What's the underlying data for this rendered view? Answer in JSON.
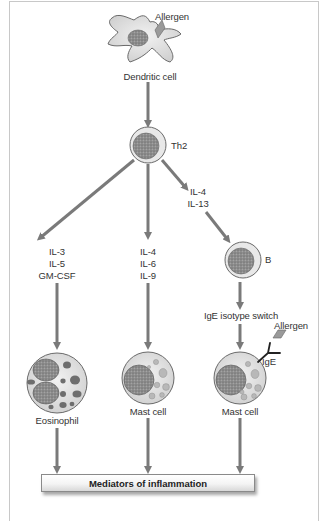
{
  "diagram": {
    "nodes": {
      "dendritic_cell": {
        "label": "Dendritic cell",
        "allergen_label": "Allergen"
      },
      "th2": {
        "label": "Th2"
      },
      "b_cell": {
        "label": "B"
      },
      "eosinophil": {
        "label": "Eosinophil"
      },
      "mast_cell_1": {
        "label": "Mast cell"
      },
      "mast_cell_2": {
        "label": "Mast cell",
        "allergen_label": "Allergen",
        "ige_label": "IgE"
      },
      "mediators": {
        "label": "Mediators of inflammation"
      }
    },
    "edges": {
      "left_cytokines": [
        "IL-3",
        "IL-5",
        "GM-CSF"
      ],
      "middle_cytokines": [
        "IL-4",
        "IL-6",
        "IL-9"
      ],
      "right_cytokines": [
        "IL-4",
        "IL-13"
      ],
      "b_to_mast": "IgE isotype switch"
    },
    "colors": {
      "arrow": "#7a7a7a",
      "cell_fill": "#e6e6e6",
      "cell_stroke": "#6a6a6a",
      "nucleus": "#8c8c8c",
      "allergen": "#9a9a9a",
      "granule_dark": "#6e6e6e",
      "granule_light": "#b8b8b8",
      "frame": "#c8c8c8"
    }
  }
}
